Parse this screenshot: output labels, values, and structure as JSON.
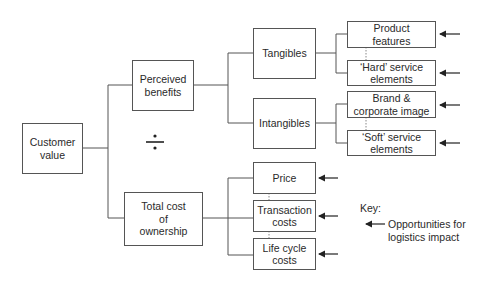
{
  "diagram": {
    "root": {
      "label": "Customer\nvalue"
    },
    "operator": {
      "symbol": "÷",
      "name": "divide"
    },
    "numerator": {
      "label": "Perceived\nbenefits",
      "children": [
        {
          "label": "Tangibles",
          "children": [
            {
              "label": "Product\nfeatures",
              "logistics_impact": true
            },
            {
              "label": "‘Hard’ service\nelements",
              "logistics_impact": true
            }
          ]
        },
        {
          "label": "Intangibles",
          "children": [
            {
              "label": "Brand &\ncorporate image",
              "logistics_impact": true
            },
            {
              "label": "‘Soft’ service\nelements",
              "logistics_impact": true
            }
          ]
        }
      ]
    },
    "denominator": {
      "label": "Total cost\nof\nownership",
      "children": [
        {
          "label": "Price",
          "logistics_impact": true
        },
        {
          "label": "Transaction\ncosts",
          "logistics_impact": true
        },
        {
          "label": "Life cycle\ncosts",
          "logistics_impact": true
        }
      ]
    }
  },
  "key": {
    "title": "Key:",
    "arrow_meaning": "Opportunities for\nlogistics impact"
  }
}
